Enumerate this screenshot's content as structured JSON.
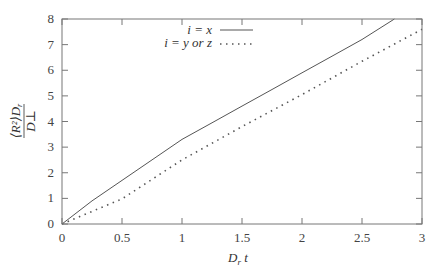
{
  "chart_data": {
    "type": "line",
    "title": "",
    "xlabel": "D_r t",
    "ylabel": "⟨R_i²⟩ D_r / D_⊥",
    "xlim": [
      0,
      3
    ],
    "ylim": [
      0,
      8
    ],
    "xticks": [
      "0",
      "0.5",
      "1",
      "1.5",
      "2",
      "2.5",
      "3"
    ],
    "yticks": [
      "0",
      "1",
      "2",
      "3",
      "4",
      "5",
      "6",
      "7",
      "8"
    ],
    "grid": false,
    "legend_position": "upper-left",
    "series": [
      {
        "name": "i = x",
        "style": "solid",
        "x": [
          0,
          0.25,
          0.5,
          0.75,
          1.0,
          1.25,
          1.5,
          1.75,
          2.0,
          2.25,
          2.5,
          2.77
        ],
        "y": [
          0,
          0.9,
          1.7,
          2.5,
          3.3,
          3.95,
          4.6,
          5.25,
          5.9,
          6.55,
          7.2,
          8.0
        ]
      },
      {
        "name": "i = y or z",
        "style": "dotted",
        "x": [
          0,
          0.5,
          1.0,
          1.5,
          2.0,
          2.5,
          3.0
        ],
        "y": [
          0,
          0.98,
          2.5,
          3.8,
          5.05,
          6.35,
          7.6
        ]
      }
    ]
  },
  "axes": {
    "xlabel_main": "D",
    "xlabel_sub": "r",
    "xlabel_tail": " t",
    "ylabel_num": "⟨R²⟩D",
    "ylabel_num_sub": "r",
    "ylabel_den": "D⊥"
  },
  "legend": {
    "entry1": "i = x",
    "entry2": "i = y or z"
  }
}
